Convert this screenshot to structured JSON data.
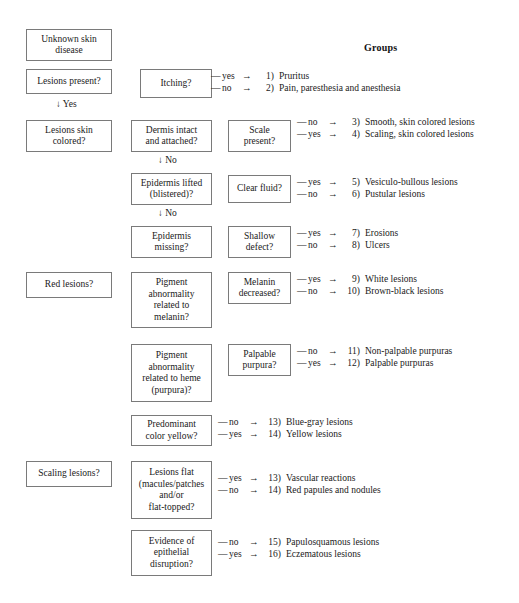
{
  "header": {
    "groups_label": "Groups"
  },
  "nodes": [
    {
      "id": "unknown-skin-disease",
      "lines": [
        "Unknown skin",
        "disease"
      ]
    },
    {
      "id": "lesions-present",
      "lines": [
        "Lesions present?"
      ]
    },
    {
      "id": "itching",
      "lines": [
        "Itching?"
      ]
    },
    {
      "id": "lesions-skin-colored",
      "lines": [
        "Lesions skin",
        "colored?"
      ]
    },
    {
      "id": "dermis-intact-and-attached",
      "lines": [
        "Dermis intact",
        "and attached?"
      ]
    },
    {
      "id": "scale-present",
      "lines": [
        "Scale",
        "present?"
      ]
    },
    {
      "id": "epidermis-lifted-blistered",
      "lines": [
        "Epidermis lifted",
        "(blistered)?"
      ]
    },
    {
      "id": "clear-fluid",
      "lines": [
        "Clear fluid?"
      ]
    },
    {
      "id": "epidermis-missing",
      "lines": [
        "Epidermis",
        "missing?"
      ]
    },
    {
      "id": "shallow-defect",
      "lines": [
        "Shallow",
        "defect?"
      ]
    },
    {
      "id": "red-lesions",
      "lines": [
        "Red lesions?"
      ]
    },
    {
      "id": "pigment-abnormality-melanin",
      "lines": [
        "Pigment",
        "abnormality",
        "related to",
        "melanin?"
      ]
    },
    {
      "id": "melanin-decreased",
      "lines": [
        "Melanin",
        "decreased?"
      ]
    },
    {
      "id": "pigment-abnormality-heme",
      "lines": [
        "Pigment",
        "abnormality",
        "related to heme",
        "(purpura)?"
      ]
    },
    {
      "id": "palpable-purpura",
      "lines": [
        "Palpable",
        "purpura?"
      ]
    },
    {
      "id": "predominant-color-yellow",
      "lines": [
        "Predominant",
        "color yellow?"
      ]
    },
    {
      "id": "scaling-lesions",
      "lines": [
        "Scaling lesions?"
      ]
    },
    {
      "id": "lesions-flat",
      "lines": [
        "Lesions flat",
        "(macules/patches",
        "and/or",
        "flat-topped?"
      ]
    },
    {
      "id": "evidence-epithelial-disruption",
      "lines": [
        "Evidence of",
        "epithelial",
        "disruption?"
      ]
    }
  ],
  "flow_arrows": [
    {
      "id": "yes-arrow-lesions-present",
      "text": "↓ Yes"
    },
    {
      "id": "no-arrow-dermis-intact",
      "text": "↓ No"
    },
    {
      "id": "no-arrow-epidermis-lifted",
      "text": "↓ No"
    }
  ],
  "outcome_groups": [
    {
      "id": "itching-outcomes",
      "rows": [
        {
          "dash": "—",
          "answer": "yes",
          "arrow": "→",
          "number": "1)",
          "text": "Pruritus"
        },
        {
          "dash": "—",
          "answer": "no",
          "arrow": "→",
          "number": "2)",
          "text": "Pain, paresthesia and anesthesia"
        }
      ]
    },
    {
      "id": "scale-present-outcomes",
      "rows": [
        {
          "dash": "—",
          "answer": "no",
          "arrow": "→",
          "number": "3)",
          "text": "Smooth, skin colored lesions"
        },
        {
          "dash": "—",
          "answer": "yes",
          "arrow": "→",
          "number": "4)",
          "text": "Scaling, skin colored lesions"
        }
      ]
    },
    {
      "id": "clear-fluid-outcomes",
      "rows": [
        {
          "dash": "—",
          "answer": "yes",
          "arrow": "→",
          "number": "5)",
          "text": "Vesiculo-bullous lesions"
        },
        {
          "dash": "—",
          "answer": "no",
          "arrow": "→",
          "number": "6)",
          "text": "Pustular lesions"
        }
      ]
    },
    {
      "id": "shallow-defect-outcomes",
      "rows": [
        {
          "dash": "—",
          "answer": "yes",
          "arrow": "→",
          "number": "7)",
          "text": "Erosions"
        },
        {
          "dash": "—",
          "answer": "no",
          "arrow": "→",
          "number": "8)",
          "text": "Ulcers"
        }
      ]
    },
    {
      "id": "melanin-decreased-outcomes",
      "rows": [
        {
          "dash": "—",
          "answer": "yes",
          "arrow": "→",
          "number": "9)",
          "text": "White lesions"
        },
        {
          "dash": "—",
          "answer": "no",
          "arrow": "→",
          "number": "10)",
          "text": "Brown-black lesions"
        }
      ]
    },
    {
      "id": "palpable-purpura-outcomes",
      "rows": [
        {
          "dash": "—",
          "answer": "no",
          "arrow": "→",
          "number": "11)",
          "text": "Non-palpable purpuras"
        },
        {
          "dash": "—",
          "answer": "yes",
          "arrow": "→",
          "number": "12)",
          "text": "Palpable purpuras"
        }
      ]
    },
    {
      "id": "predominant-color-yellow-outcomes",
      "rows": [
        {
          "dash": "—",
          "answer": "no",
          "arrow": "→",
          "number": "13)",
          "text": "Blue-gray lesions"
        },
        {
          "dash": "—",
          "answer": "yes",
          "arrow": "→",
          "number": "14)",
          "text": "Yellow lesions"
        }
      ]
    },
    {
      "id": "lesions-flat-outcomes",
      "rows": [
        {
          "dash": "—",
          "answer": "yes",
          "arrow": "→",
          "number": "13)",
          "text": "Vascular reactions"
        },
        {
          "dash": "—",
          "answer": "no",
          "arrow": "→",
          "number": "14)",
          "text": "Red papules and nodules"
        }
      ]
    },
    {
      "id": "epithelial-disruption-outcomes",
      "rows": [
        {
          "dash": "—",
          "answer": "no",
          "arrow": "→",
          "number": "15)",
          "text": "Papulosquamous lesions"
        },
        {
          "dash": "—",
          "answer": "yes",
          "arrow": "→",
          "number": "16)",
          "text": "Eczematous lesions"
        }
      ]
    }
  ]
}
